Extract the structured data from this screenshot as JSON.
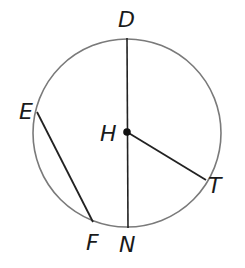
{
  "diagram": {
    "type": "circle-geometry",
    "circle": {
      "cx": 127,
      "cy": 133,
      "r": 94,
      "stroke": "#7a7a7a"
    },
    "center": {
      "name": "H",
      "x": 127,
      "y": 132
    },
    "points": {
      "D": {
        "x": 127,
        "y": 38
      },
      "N": {
        "x": 128,
        "y": 228
      },
      "E": {
        "x": 37,
        "y": 112
      },
      "F": {
        "x": 93,
        "y": 222
      },
      "T": {
        "x": 206,
        "y": 180
      }
    },
    "segments": [
      {
        "name": "DN",
        "from": "D",
        "to": "N",
        "kind": "diameter"
      },
      {
        "name": "HT",
        "from": "H",
        "to": "T",
        "kind": "radius"
      },
      {
        "name": "EF",
        "from": "E",
        "to": "F",
        "kind": "chord"
      }
    ],
    "labels": {
      "D": "D",
      "H": "H",
      "E": "E",
      "T": "T",
      "F": "F",
      "N": "N"
    },
    "line_color": "#222222"
  }
}
